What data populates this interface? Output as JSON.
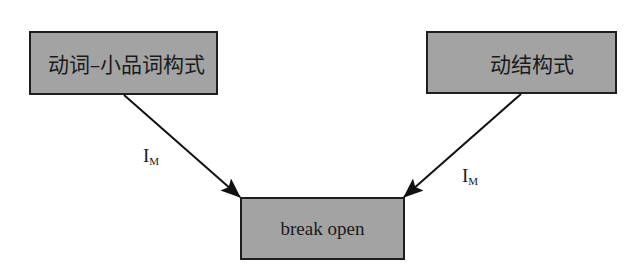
{
  "diagram": {
    "type": "flow-diagram",
    "nodes": [
      {
        "id": "left",
        "label": "动词–小品词构式"
      },
      {
        "id": "right",
        "label": "动结构式"
      },
      {
        "id": "bottom",
        "label": "break open"
      }
    ],
    "edges": [
      {
        "from": "left",
        "to": "bottom",
        "label_main": "I",
        "label_sub": "M"
      },
      {
        "from": "right",
        "to": "bottom",
        "label_main": "I",
        "label_sub": "M"
      }
    ],
    "colors": {
      "box_fill": "#a3a3a3",
      "box_border": "#1e1e1e",
      "arrow": "#111111",
      "text": "#1a1a1a"
    }
  }
}
